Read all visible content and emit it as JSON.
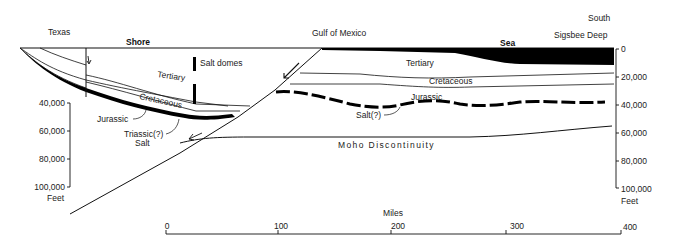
{
  "places": {
    "texas": "Texas",
    "gulf": "Gulf of Mexico",
    "south": "South",
    "sigsbee": "Sigsbee Deep",
    "shore": "Shore",
    "sea": "Sea"
  },
  "strata": {
    "tertiary_left": "Tertiary",
    "cretaceous_left": "Cretaceous",
    "jurassic_left": "Jurassic",
    "triassic_left": "Triassic(?)",
    "salt_left": "Salt",
    "salt_domes": "Salt domes",
    "tertiary_right": "Tertiary",
    "cretaceous_right": "Cretaceous",
    "jurassic_right": "Jurassic",
    "salt_right": "Salt(?)",
    "moho": "Moho Discontinuity"
  },
  "left_axis": {
    "ticks": [
      "40,000",
      "60,000",
      "80,000",
      "100,000"
    ],
    "unit": "Feet"
  },
  "right_axis": {
    "ticks": [
      "0",
      "20,000",
      "40,000",
      "60,000",
      "80,000",
      "100,000"
    ],
    "unit": "Feet"
  },
  "distance_scale": {
    "title": "Miles",
    "ticks": [
      "0",
      "100",
      "200",
      "300",
      "400"
    ]
  }
}
